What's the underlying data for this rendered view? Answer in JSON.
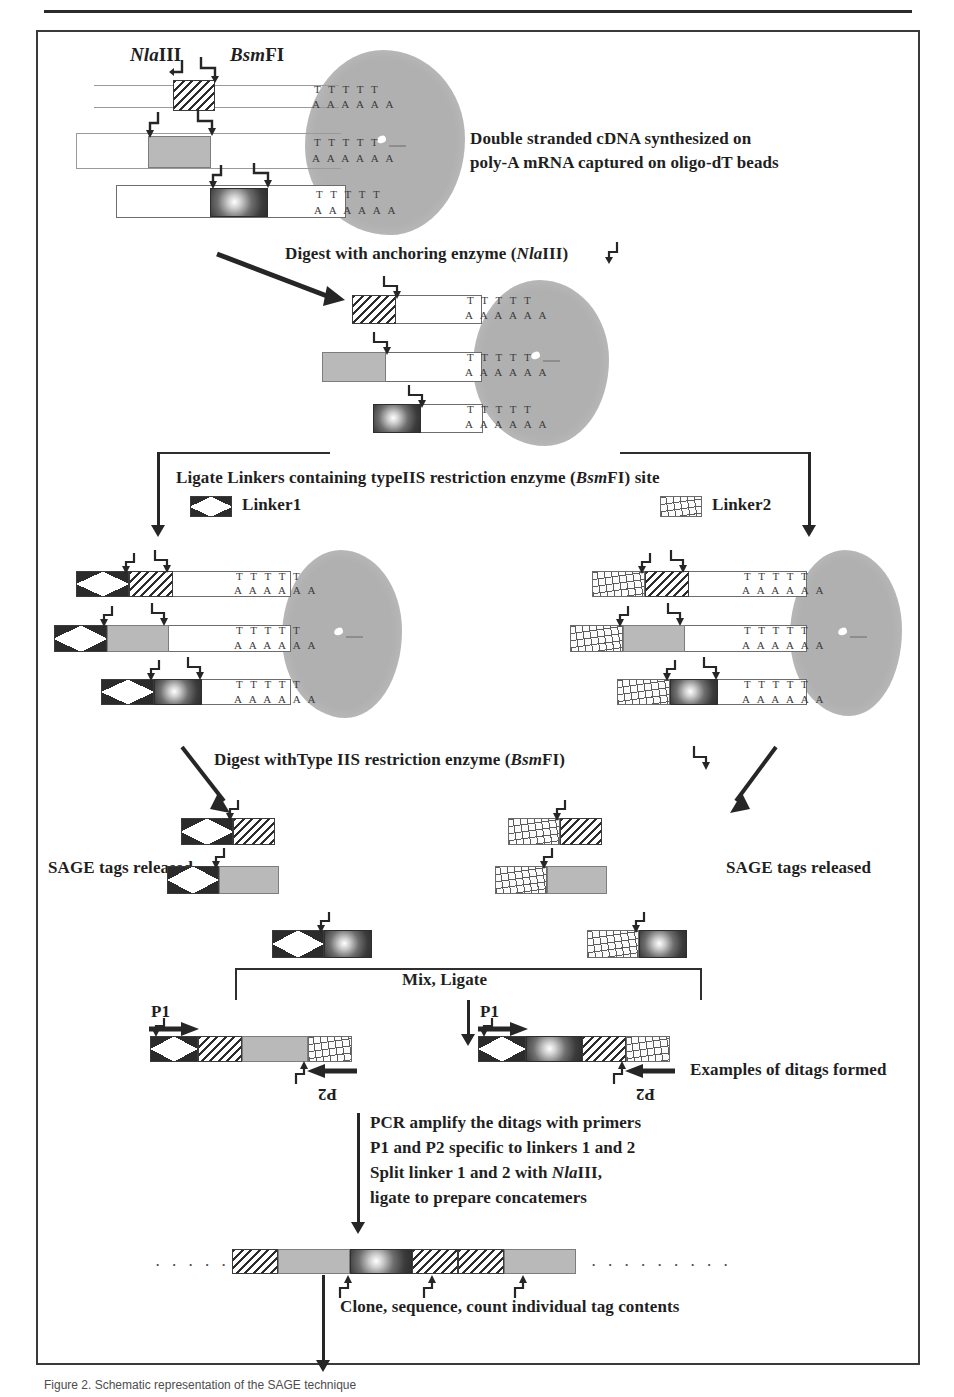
{
  "figure": {
    "caption": "Figure 2. Schematic representation of the SAGE technique",
    "enzymes": {
      "anchoring_italic": "Nla",
      "anchoring_roman": "III",
      "tagging_italic": "Bsm",
      "tagging_roman": "FI"
    }
  },
  "top_labels": {
    "nlaIII_italic": "Nla",
    "nlaIII_roman": "III",
    "bsmFI_italic": "Bsm",
    "bsmFI_roman": "FI"
  },
  "steps": {
    "step1_line1": "Double stranded cDNA synthesized on",
    "step1_line2": "poly-A mRNA captured on oligo-dT beads",
    "step2_pre": "Digest with anchoring enzyme (",
    "step2_italic": "Nla",
    "step2_roman": "III",
    "step2_post": ")",
    "step3_pre": "Ligate Linkers containing  typeIIS restriction enzyme (",
    "step3_italic": "Bsm",
    "step3_roman": "FI",
    "step3_post": ") site",
    "linker1_label": "Linker1",
    "linker2_label": "Linker2",
    "step4_pre": "Digest withType IIS restriction enzyme (",
    "step4_italic": "Bsm",
    "step4_roman": "FI",
    "step4_post": ")",
    "sage_tags_left": "SAGE tags released",
    "sage_tags_right": "SAGE tags released",
    "mix_ligate": "Mix, Ligate",
    "ditags_label": "Examples of ditags formed",
    "pcr_line1": "PCR amplify the ditags with primers",
    "pcr_line2": "P1 and P2 specific to linkers 1 and 2",
    "pcr_line3_pre": "Split linker 1 and 2 with ",
    "pcr_line3_italic": "Nla",
    "pcr_line3_roman": "III",
    "pcr_line3_post": ",",
    "pcr_line4": "ligate to prepare concatemers",
    "final_step": "Clone, sequence, count individual tag contents"
  },
  "primers": {
    "p1_left": "P1",
    "p2_left": "P2",
    "p1_right": "P1",
    "p2_right": "P2"
  },
  "sequence": {
    "poly_t": "T T T T T",
    "poly_a": "A A A A A A",
    "concatemer_dots_left": ". . . . . .",
    "concatemer_dots_right": ". . . . . . . . ."
  },
  "colors": {
    "ink": "#1f1f1f",
    "frame": "#3a3a3a",
    "bead": "#b0b0b0",
    "tag_grey": "#b9b9b9",
    "tag_dark": "#2e2e2e"
  }
}
